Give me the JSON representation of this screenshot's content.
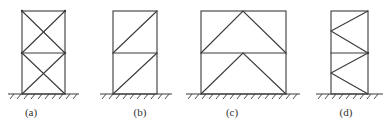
{
  "diagram": {
    "type": "braced-frame-configurations",
    "colors": {
      "line": "#3a3a3a",
      "background": "#ffffff"
    },
    "frames": [
      {
        "id": "a",
        "label": "(a)",
        "bracing": "X-bracing (cross) in both stories",
        "left": 22,
        "right": 65,
        "top": 11,
        "mid": 53,
        "bottom": 94,
        "ground": [
          8,
          79
        ],
        "label_x": 31
      },
      {
        "id": "b",
        "label": "(b)",
        "bracing": "single diagonal in both stories",
        "left": 113,
        "right": 157,
        "top": 11,
        "mid": 53,
        "bottom": 94,
        "ground": [
          100,
          172
        ],
        "label_x": 140
      },
      {
        "id": "c",
        "label": "(c)",
        "bracing": "inverted-V (chevron) in both stories",
        "left": 201,
        "right": 286,
        "top": 11,
        "mid": 53,
        "bottom": 94,
        "ground": [
          186,
          300
        ],
        "label_x": 232
      },
      {
        "id": "d",
        "label": "(d)",
        "bracing": "K-type / zigzag bracing in both stories",
        "left": 331,
        "right": 368,
        "top": 11,
        "mid": 53,
        "bottom": 94,
        "ground": [
          316,
          383
        ],
        "label_x": 346
      }
    ]
  }
}
